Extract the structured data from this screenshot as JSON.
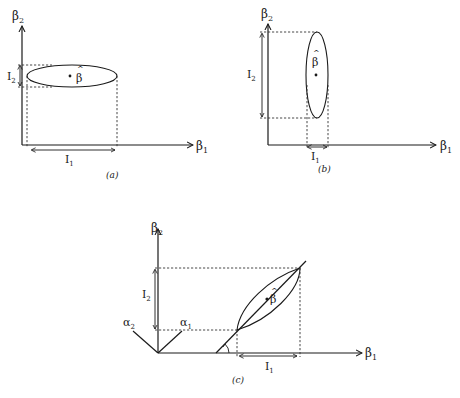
{
  "figure": {
    "panels": [
      {
        "id": "a",
        "caption": "(a)",
        "x_axis_label": "β₁",
        "y_axis_label": "β₂",
        "estimate_label": "β̂",
        "interval_x_label": "I₁",
        "interval_y_label": "I₂",
        "ellipse_orientation": "horizontal (wide, flat)"
      },
      {
        "id": "b",
        "caption": "(b)",
        "x_axis_label": "β₁",
        "y_axis_label": "β₂",
        "estimate_label": "β̂",
        "interval_x_label": "I₁",
        "interval_y_label": "I₂",
        "ellipse_orientation": "vertical (tall, narrow)"
      },
      {
        "id": "c",
        "caption": "(c)",
        "x_axis_label": "β₁",
        "y_axis_label": "β₂",
        "estimate_label": "β̂",
        "interval_x_label": "I₁",
        "interval_y_label": "I₂",
        "rotated_axis_1_label": "α₁",
        "rotated_axis_2_label": "α₂",
        "ellipse_orientation": "diagonal (elongated along a line at angle θ)"
      }
    ]
  },
  "text": {
    "beta1": "β",
    "beta2": "β",
    "sub1": "1",
    "sub2": "2",
    "I": "I",
    "hat": "^",
    "beta": "β",
    "alpha": "α",
    "cap_a": "(a)",
    "cap_b": "(b)",
    "cap_c": "(c)"
  }
}
